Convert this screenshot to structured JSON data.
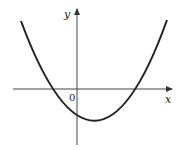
{
  "diagram": {
    "type": "parabola-graph",
    "axes": {
      "x_label": "x",
      "y_label": "y",
      "origin_label": "0"
    },
    "curve": {
      "description": "upward-opening parabola with vertex below and right of origin, two x-intercepts (one negative, one positive), negative y-intercept",
      "color": "#222222"
    },
    "colors": {
      "axis": "#333333",
      "curve": "#222222",
      "background": "#ffffff"
    }
  }
}
